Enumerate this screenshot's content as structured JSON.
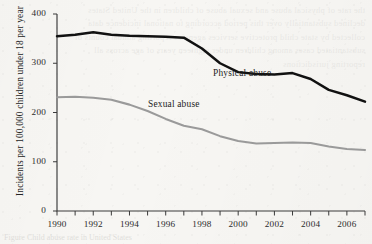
{
  "figure": {
    "background_color": "#f7f6f3",
    "caption_fragment": "Figure          Child abuse rate in United States"
  },
  "chart_data": {
    "type": "line",
    "title": "",
    "xlabel": "",
    "ylabel": "Incidents per 100,000 children under 18 per year",
    "xlim": [
      1990,
      2007
    ],
    "ylim": [
      0,
      400
    ],
    "grid": false,
    "legend": "inline-annotations",
    "x": [
      1990,
      1991,
      1992,
      1993,
      1994,
      1995,
      1996,
      1997,
      1998,
      1999,
      2000,
      2001,
      2002,
      2003,
      2004,
      2005,
      2006,
      2007
    ],
    "x_tick_labels": [
      "1990",
      "1992",
      "1994",
      "1996",
      "1998",
      "2000",
      "2002",
      "2004",
      "2006"
    ],
    "y_tick_labels": [
      "0",
      "100",
      "200",
      "300",
      "400"
    ],
    "y_ticks": [
      0,
      100,
      200,
      300,
      400
    ],
    "series": [
      {
        "name": "Physical abuse",
        "color": "#111111",
        "values": [
          355,
          358,
          363,
          358,
          356,
          355,
          354,
          352,
          330,
          300,
          282,
          278,
          277,
          280,
          268,
          246,
          235,
          222
        ],
        "annotation": "Physical abuse"
      },
      {
        "name": "Sexual abuse",
        "color": "#9a9a9a",
        "values": [
          231,
          232,
          230,
          226,
          216,
          203,
          187,
          173,
          166,
          152,
          142,
          137,
          138,
          139,
          138,
          131,
          126,
          124
        ],
        "annotation": "Sexual abuse"
      }
    ]
  },
  "axes": {
    "y_title": "Incidents per 100,000 children under 18 per year",
    "y_labels": [
      {
        "text": "400",
        "value": 400
      },
      {
        "text": "300",
        "value": 300
      },
      {
        "text": "200",
        "value": 200
      },
      {
        "text": "100",
        "value": 100
      },
      {
        "text": "0",
        "value": 0
      }
    ],
    "x_labels": [
      {
        "text": "1990",
        "value": 1990
      },
      {
        "text": "1992",
        "value": 1992
      },
      {
        "text": "1994",
        "value": 1994
      },
      {
        "text": "1996",
        "value": 1996
      },
      {
        "text": "1998",
        "value": 1998
      },
      {
        "text": "2000",
        "value": 2000
      },
      {
        "text": "2002",
        "value": 2002
      },
      {
        "text": "2004",
        "value": 2004
      },
      {
        "text": "2006",
        "value": 2006
      }
    ]
  },
  "annotations": {
    "physical": "Physical abuse",
    "sexual": "Sexual abuse"
  },
  "bleed_through_text": "the rate of physical abuse and sexual abuse of children in the United States declined substantially over this period according to national incidence data collected by state child protective services agencies reporting annual counts of substantiated cases among children under eighteen years of age across all reporting jurisdictions"
}
